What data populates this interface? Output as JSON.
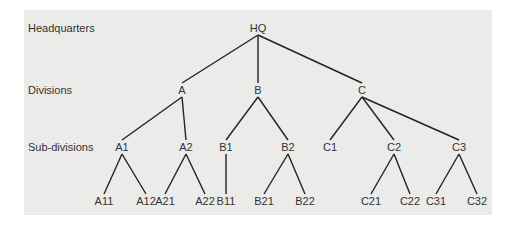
{
  "levels": [
    {
      "label": "Headquarters",
      "y": 28
    },
    {
      "label": "Divisions",
      "y": 90
    },
    {
      "label": "Sub-divisions",
      "y": 147
    }
  ],
  "nodes": [
    {
      "id": "HQ",
      "label": "HQ",
      "x": 258,
      "y": 28
    },
    {
      "id": "A",
      "label": "A",
      "x": 182,
      "y": 90
    },
    {
      "id": "B",
      "label": "B",
      "x": 258,
      "y": 90
    },
    {
      "id": "C",
      "label": "C",
      "x": 362,
      "y": 90
    },
    {
      "id": "A1",
      "label": "A1",
      "x": 122,
      "y": 147
    },
    {
      "id": "A2",
      "label": "A2",
      "x": 186,
      "y": 147
    },
    {
      "id": "B1",
      "label": "B1",
      "x": 226,
      "y": 147
    },
    {
      "id": "B2",
      "label": "B2",
      "x": 288,
      "y": 147
    },
    {
      "id": "C1",
      "label": "C1",
      "x": 330,
      "y": 147
    },
    {
      "id": "C2",
      "label": "C2",
      "x": 394,
      "y": 147
    },
    {
      "id": "C3",
      "label": "C3",
      "x": 459,
      "y": 147
    },
    {
      "id": "A11",
      "label": "A11",
      "x": 104,
      "y": 201
    },
    {
      "id": "A12",
      "label": "A12",
      "x": 146,
      "y": 201
    },
    {
      "id": "A21",
      "label": "A21",
      "x": 165,
      "y": 201
    },
    {
      "id": "A22",
      "label": "A22",
      "x": 205,
      "y": 201
    },
    {
      "id": "B11",
      "label": "B11",
      "x": 226,
      "y": 201
    },
    {
      "id": "B21",
      "label": "B21",
      "x": 264,
      "y": 201
    },
    {
      "id": "B22",
      "label": "B22",
      "x": 305,
      "y": 201
    },
    {
      "id": "C21",
      "label": "C21",
      "x": 371,
      "y": 201
    },
    {
      "id": "C22",
      "label": "C22",
      "x": 410,
      "y": 201
    },
    {
      "id": "C31",
      "label": "C31",
      "x": 436,
      "y": 201
    },
    {
      "id": "C32",
      "label": "C32",
      "x": 477,
      "y": 201
    }
  ],
  "edges": [
    [
      "HQ",
      "A"
    ],
    [
      "HQ",
      "B"
    ],
    [
      "HQ",
      "C"
    ],
    [
      "A",
      "A1"
    ],
    [
      "A",
      "A2"
    ],
    [
      "B",
      "B1"
    ],
    [
      "B",
      "B2"
    ],
    [
      "C",
      "C1"
    ],
    [
      "C",
      "C2"
    ],
    [
      "C",
      "C3"
    ],
    [
      "A1",
      "A11"
    ],
    [
      "A1",
      "A12"
    ],
    [
      "A2",
      "A21"
    ],
    [
      "A2",
      "A22"
    ],
    [
      "B1",
      "B11"
    ],
    [
      "B2",
      "B21"
    ],
    [
      "B2",
      "B22"
    ],
    [
      "C2",
      "C21"
    ],
    [
      "C2",
      "C22"
    ],
    [
      "C3",
      "C31"
    ],
    [
      "C3",
      "C32"
    ]
  ],
  "colors": {
    "background": "#ebebea",
    "line": "#222222",
    "text": "#333333"
  }
}
